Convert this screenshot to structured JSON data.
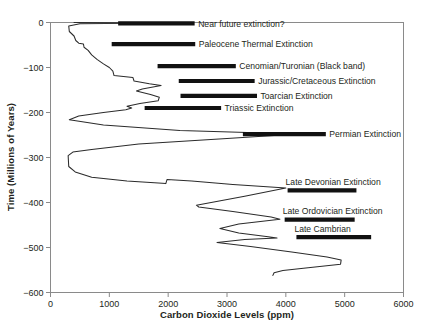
{
  "chart_data": {
    "type": "line",
    "title": "",
    "xlabel": "Carbon Dioxide Levels (ppm)",
    "ylabel": "Time (Millions of Years)",
    "xlim": [
      0,
      6000
    ],
    "ylim": [
      -600,
      0
    ],
    "grid": false,
    "legend": "none",
    "orientation": "vertical-time-axis",
    "xticks": [
      {
        "value": 0,
        "label": "0"
      },
      {
        "value": 1000,
        "label": "1000"
      },
      {
        "value": 2000,
        "label": "2000"
      },
      {
        "value": 3000,
        "label": "3000"
      },
      {
        "value": 4000,
        "label": "4000"
      },
      {
        "value": 5000,
        "label": "5000"
      },
      {
        "value": 6000,
        "label": "6000"
      }
    ],
    "yticks": [
      {
        "value": 0,
        "label": "0"
      },
      {
        "value": -100,
        "label": "−100"
      },
      {
        "value": -200,
        "label": "−200"
      },
      {
        "value": -300,
        "label": "−300"
      },
      {
        "value": -400,
        "label": "−400"
      },
      {
        "value": -500,
        "label": "−500"
      },
      {
        "value": -600,
        "label": "−600"
      }
    ],
    "series": [
      {
        "name": "Atmospheric CO2",
        "points": [
          [
            400,
            0
          ],
          [
            1800,
            -1
          ],
          [
            500,
            -3
          ],
          [
            310,
            -8
          ],
          [
            320,
            -20
          ],
          [
            400,
            -30
          ],
          [
            430,
            -40
          ],
          [
            480,
            -46
          ],
          [
            560,
            -48
          ],
          [
            570,
            -55
          ],
          [
            640,
            -62
          ],
          [
            700,
            -72
          ],
          [
            790,
            -82
          ],
          [
            900,
            -92
          ],
          [
            1000,
            -100
          ],
          [
            1060,
            -108
          ],
          [
            1080,
            -118
          ],
          [
            1400,
            -122
          ],
          [
            1420,
            -130
          ],
          [
            1680,
            -136
          ],
          [
            1880,
            -140
          ],
          [
            1560,
            -148
          ],
          [
            1460,
            -152
          ],
          [
            1700,
            -160
          ],
          [
            1850,
            -166
          ],
          [
            1830,
            -174
          ],
          [
            1520,
            -180
          ],
          [
            1300,
            -186
          ],
          [
            1380,
            -190
          ],
          [
            1280,
            -194
          ],
          [
            900,
            -200
          ],
          [
            480,
            -208
          ],
          [
            320,
            -216
          ],
          [
            900,
            -228
          ],
          [
            2200,
            -240
          ],
          [
            4200,
            -248
          ],
          [
            3000,
            -258
          ],
          [
            1500,
            -270
          ],
          [
            700,
            -282
          ],
          [
            380,
            -288
          ],
          [
            300,
            -296
          ],
          [
            310,
            -320
          ],
          [
            420,
            -332
          ],
          [
            700,
            -344
          ],
          [
            1300,
            -352
          ],
          [
            1900,
            -357
          ],
          [
            1960,
            -358
          ],
          [
            1980,
            -349
          ],
          [
            2400,
            -352
          ],
          [
            3100,
            -360
          ],
          [
            4000,
            -368
          ],
          [
            3300,
            -386
          ],
          [
            2480,
            -406
          ],
          [
            2520,
            -410
          ],
          [
            3100,
            -420
          ],
          [
            3750,
            -432
          ],
          [
            3900,
            -437
          ],
          [
            3200,
            -448
          ],
          [
            2880,
            -458
          ],
          [
            3200,
            -468
          ],
          [
            3700,
            -476
          ],
          [
            3850,
            -479
          ],
          [
            3300,
            -482
          ],
          [
            2830,
            -489
          ],
          [
            3400,
            -498
          ],
          [
            4100,
            -510
          ],
          [
            4700,
            -521
          ],
          [
            4940,
            -528
          ],
          [
            4930,
            -537
          ],
          [
            4300,
            -546
          ],
          [
            3950,
            -551
          ],
          [
            3800,
            -556
          ],
          [
            3780,
            -562
          ]
        ]
      }
    ],
    "annotations": [
      {
        "label": "Near future extinction?",
        "bar_x_start": 1150,
        "bar_x_end": 2450,
        "time": -2,
        "label_side": "right"
      },
      {
        "label": "Paleocene Thermal Extinction",
        "bar_x_start": 1040,
        "bar_x_end": 2460,
        "time": -48,
        "label_side": "right"
      },
      {
        "label": "Cenomian/Turonian (Black band)",
        "bar_x_start": 1820,
        "bar_x_end": 3150,
        "time": -97,
        "label_side": "right"
      },
      {
        "label": "Jurassic/Cretaceous Extinction",
        "bar_x_start": 2180,
        "bar_x_end": 3470,
        "time": -130,
        "label_side": "right"
      },
      {
        "label": "Toarcian Extinction",
        "bar_x_start": 2210,
        "bar_x_end": 3510,
        "time": -163,
        "label_side": "right"
      },
      {
        "label": "Triassic Extinction",
        "bar_x_start": 1600,
        "bar_x_end": 2900,
        "time": -190,
        "label_side": "right"
      },
      {
        "label": "Permian Extinction",
        "bar_x_start": 3270,
        "bar_x_end": 4680,
        "time": -248,
        "label_side": "right"
      },
      {
        "label": "Late Devonian Extinction",
        "bar_x_start": 4030,
        "bar_x_end": 5200,
        "time": -373,
        "label_side": "above"
      },
      {
        "label": "Late Ordovician Extinction",
        "bar_x_start": 3980,
        "bar_x_end": 5170,
        "time": -438,
        "label_side": "above"
      },
      {
        "label": "Late Cambrian",
        "bar_x_start": 4180,
        "bar_x_end": 5450,
        "time": -477,
        "label_side": "above"
      }
    ]
  }
}
